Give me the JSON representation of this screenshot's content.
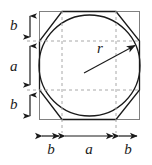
{
  "figure": {
    "colors": {
      "square_stroke": "#808080",
      "octagon_stroke": "#1a1a1a",
      "circle_stroke": "#1a1a1a",
      "dashed_stroke": "#a8a8a8",
      "arrow_stroke": "#1a1a1a",
      "label_color": "#1a1a1a",
      "background": "#ffffff"
    },
    "labels": {
      "left_b_top": "b",
      "left_a": "a",
      "left_b_bottom": "b",
      "bottom_b_left": "b",
      "bottom_a": "a",
      "bottom_b_right": "b",
      "radius": "r"
    },
    "shapes": {
      "square": {
        "x": 39,
        "y": 11,
        "width": 101,
        "height": 109
      },
      "circle": {
        "cx": 89.5,
        "cy": 65.5,
        "r": 50.5
      },
      "octagon_points": "62,11 116,11 140,41 140,90 116,120 62,120 39,90 39,41",
      "dashed_vertical_left_x": 62,
      "dashed_vertical_right_x": 116,
      "dashed_horizontal_top_y": 41,
      "dashed_horizontal_bottom_y": 90
    },
    "dimensions": {
      "vertical_axis_x": 30,
      "vertical_segments": [
        {
          "name": "b",
          "from_y": 12,
          "to_y": 41
        },
        {
          "name": "a",
          "from_y": 41,
          "to_y": 90
        },
        {
          "name": "b",
          "from_y": 90,
          "to_y": 119
        }
      ],
      "horizontal_axis_y": 136,
      "horizontal_segments": [
        {
          "name": "b",
          "from_x": 39,
          "to_x": 62
        },
        {
          "name": "a",
          "from_x": 62,
          "to_x": 116
        },
        {
          "name": "b",
          "from_x": 116,
          "to_x": 140
        }
      ],
      "radius_arrow": {
        "from_x": 84,
        "from_y": 73,
        "to_x": 136,
        "to_y": 45
      }
    }
  }
}
